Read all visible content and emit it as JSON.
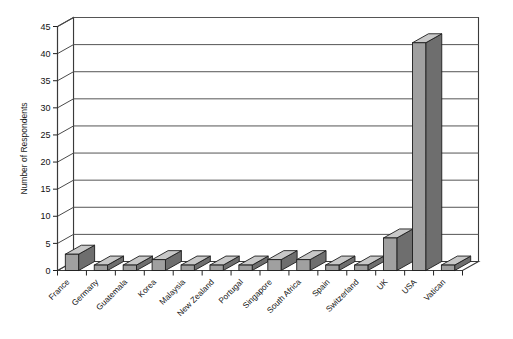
{
  "chart_data": {
    "type": "bar",
    "title": "",
    "subtitle": "",
    "xlabel": "",
    "ylabel": "Number of Respondents",
    "categories": [
      "France",
      "Germany",
      "Guatemala",
      "Korea",
      "Malaysia",
      "New Zealand",
      "Portugal",
      "Singapore",
      "South Africa",
      "Spain",
      "Switzerland",
      "UK",
      "USA",
      "Vatican"
    ],
    "values": [
      3,
      1,
      1,
      2,
      1,
      1,
      1,
      2,
      2,
      1,
      1,
      6,
      42,
      1
    ],
    "ylim": [
      0,
      45
    ],
    "yticks": [
      0,
      5,
      10,
      15,
      20,
      25,
      30,
      35,
      40,
      45
    ],
    "ytick_labels": [
      "0",
      "5",
      "10",
      "15",
      "20",
      "25",
      "30",
      "35",
      "40",
      "45"
    ],
    "grid": true,
    "grid_axis": "y",
    "legend": false,
    "legend_position": "none",
    "style_3d": true,
    "bar_color": "#a0a0a0",
    "bar_top_color": "#c8c8c8",
    "bar_side_color": "#6e6e6e",
    "bar_edge_color": "#1d1d1d",
    "grid_color": "#555555",
    "frame_color": "#3a3a3a",
    "background_color": "#ffffff",
    "text_color": "#111111",
    "category_label_rotation": -45
  }
}
